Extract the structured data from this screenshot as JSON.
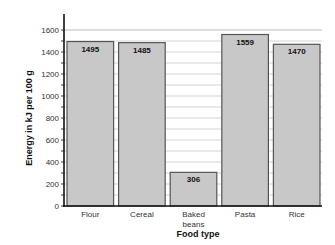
{
  "chart_data": {
    "type": "bar",
    "title": "",
    "xlabel": "Food type",
    "ylabel": "Energy in kJ per 100 g",
    "categories": [
      "Flour",
      "Cereal",
      "Baked beans",
      "Pasta",
      "Rice"
    ],
    "category_lines": [
      [
        "Flour"
      ],
      [
        "Cereal"
      ],
      [
        "Baked",
        "beans"
      ],
      [
        "Pasta"
      ],
      [
        "Rice"
      ]
    ],
    "values": [
      1495,
      1485,
      306,
      1559,
      1470
    ],
    "data_labels": [
      "1495",
      "1485",
      "306",
      "1559",
      "1470"
    ],
    "ylim": [
      0,
      1700
    ],
    "yticks": [
      0,
      200,
      400,
      600,
      800,
      1000,
      1200,
      1400,
      1600
    ],
    "grid": true,
    "grid_step": 100,
    "legend": null,
    "bar_color": "#c8c8c8",
    "bar_edge_color": "#555555"
  }
}
